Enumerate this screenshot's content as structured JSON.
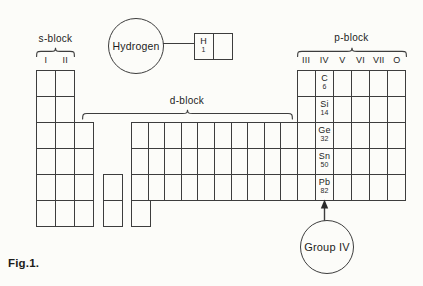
{
  "figure": {
    "caption": "Fig.1."
  },
  "blocks": {
    "s": {
      "label": "s-block",
      "groups": [
        "I",
        "II"
      ]
    },
    "d": {
      "label": "d-block"
    },
    "p": {
      "label": "p-block",
      "groups": [
        "III",
        "IV",
        "V",
        "VI",
        "VII",
        "O"
      ]
    }
  },
  "hydrogen": {
    "callout": "Hydrogen",
    "cell": {
      "symbol": "H",
      "number": "1"
    }
  },
  "group_iv": {
    "callout": "Group IV",
    "elements": [
      {
        "symbol": "C",
        "number": "6"
      },
      {
        "symbol": "Si",
        "number": "14"
      },
      {
        "symbol": "Ge",
        "number": "32"
      },
      {
        "symbol": "Sn",
        "number": "50"
      },
      {
        "symbol": "Pb",
        "number": "82"
      }
    ]
  },
  "colors": {
    "line": "#3d3d3d",
    "text": "#1c1c1c",
    "background": "#fcfcf9"
  }
}
